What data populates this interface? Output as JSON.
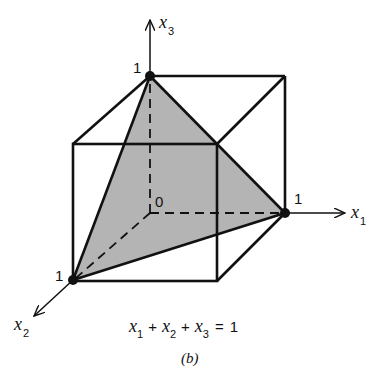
{
  "figure": {
    "caption": "(b)",
    "equation": {
      "terms": [
        "x",
        "1",
        "+",
        "x",
        "2",
        "+",
        "x",
        "3",
        "=",
        "1"
      ],
      "text": "x1 + x2 + x3 = 1"
    },
    "axes": {
      "x1": {
        "name": "x",
        "sub": "1"
      },
      "x2": {
        "name": "x",
        "sub": "2"
      },
      "x3": {
        "name": "x",
        "sub": "3"
      }
    },
    "tick_labels": {
      "x1": "1",
      "x2": "1",
      "x3": "1",
      "origin": "0"
    },
    "colors": {
      "stroke": "#111111",
      "plane_fill": "#b4b4b4",
      "background": "#ffffff"
    },
    "shapes": {
      "unit_cube": "unit cube wireframe",
      "simplex": "shaded triangle x1+x2+x3=1 with vertices (1,0,0),(0,1,0),(0,0,1)"
    }
  }
}
